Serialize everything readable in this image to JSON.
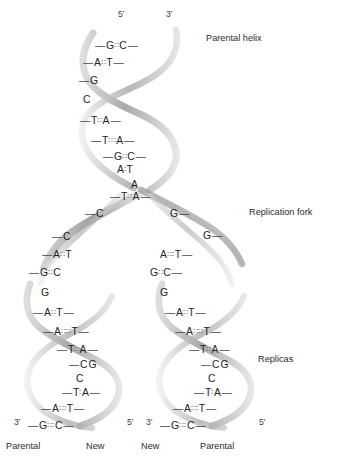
{
  "diagram": {
    "title_annotations": [
      {
        "name": "parental-helix",
        "label": "Parental helix",
        "x": 206,
        "y": 34
      },
      {
        "name": "replication-fork",
        "label": "Replication fork",
        "x": 249,
        "y": 208
      },
      {
        "name": "replicas",
        "label": "Replicas",
        "x": 258,
        "y": 355
      }
    ],
    "top_end_labels": [
      {
        "name": "five-prime-top",
        "label": "5′",
        "x": 118,
        "y": 10
      },
      {
        "name": "three-prime-top",
        "label": "3′",
        "x": 166,
        "y": 10
      }
    ],
    "bottom_end_labels": [
      {
        "name": "three-prime-left",
        "label": "3′",
        "x": 14,
        "y": 418
      },
      {
        "name": "five-prime-left",
        "label": "5′",
        "x": 127,
        "y": 418
      },
      {
        "name": "three-prime-right",
        "label": "3′",
        "x": 146,
        "y": 418
      },
      {
        "name": "five-prime-right",
        "label": "5′",
        "x": 259,
        "y": 418
      }
    ],
    "foot_labels": [
      {
        "name": "foot-parental-left",
        "label": "Parental",
        "x": 6,
        "y": 442
      },
      {
        "name": "foot-new-left",
        "label": "New",
        "x": 86,
        "y": 442
      },
      {
        "name": "foot-new-right",
        "label": "New",
        "x": 141,
        "y": 442
      },
      {
        "name": "foot-parental-right",
        "label": "Parental",
        "x": 200,
        "y": 442
      }
    ],
    "colors": {
      "ribbon_dark": "#8a8a8a",
      "ribbon_light": "#d2d2d2",
      "text": "#231f20",
      "background": "#ffffff"
    },
    "base_pairs": {
      "parental_helix": [
        {
          "left": "G",
          "right": "C",
          "bond": "∶∶",
          "ldash": true,
          "rdash": true,
          "x": 95,
          "y": 41
        },
        {
          "left": "A",
          "right": "T",
          "bond": "∶∶",
          "ldash": true,
          "rdash": true,
          "x": 83,
          "y": 58
        },
        {
          "left": "G",
          "right": "",
          "bond": "",
          "ldash": true,
          "rdash": false,
          "x": 79,
          "y": 76
        },
        {
          "left": "C",
          "right": "",
          "bond": "",
          "ldash": false,
          "rdash": false,
          "x": 83,
          "y": 95
        },
        {
          "left": "T",
          "right": "A",
          "bond": "∶∶",
          "ldash": true,
          "rdash": true,
          "x": 80,
          "y": 116
        },
        {
          "left": "T",
          "right": "A",
          "bond": "∶∶∶",
          "ldash": true,
          "rdash": true,
          "x": 91,
          "y": 136
        },
        {
          "left": "G",
          "right": "C",
          "bond": "∶∶",
          "ldash": true,
          "rdash": true,
          "x": 103,
          "y": 152
        },
        {
          "left": "A",
          "right": "T",
          "bond": "∶",
          "ldash": false,
          "rdash": false,
          "x": 117,
          "y": 165
        },
        {
          "left": "A",
          "right": "",
          "bond": "",
          "ldash": false,
          "rdash": false,
          "x": 131,
          "y": 180
        },
        {
          "left": "T",
          "right": "A",
          "bond": "∶∶",
          "ldash": true,
          "rdash": true,
          "x": 110,
          "y": 192
        }
      ],
      "fork_left_branch": [
        {
          "left": "C",
          "right": "",
          "bond": "",
          "ldash": true,
          "rdash": false,
          "x": 85,
          "y": 209
        },
        {
          "left": "C",
          "right": "",
          "bond": "",
          "ldash": true,
          "rdash": false,
          "x": 52,
          "y": 232
        },
        {
          "left": "A",
          "right": "T",
          "bond": "∶∶",
          "ldash": true,
          "rdash": false,
          "x": 42,
          "y": 250
        },
        {
          "left": "G",
          "right": "C",
          "bond": "∶∶",
          "ldash": true,
          "rdash": false,
          "x": 29,
          "y": 268
        },
        {
          "left": "G",
          "right": "",
          "bond": "",
          "ldash": false,
          "rdash": false,
          "x": 41,
          "y": 288
        }
      ],
      "fork_right_branch": [
        {
          "left": "G",
          "right": "",
          "bond": "",
          "ldash": false,
          "rdash": true,
          "x": 170,
          "y": 209
        },
        {
          "left": "G",
          "right": "",
          "bond": "",
          "ldash": false,
          "rdash": true,
          "x": 203,
          "y": 231
        },
        {
          "left": "A",
          "right": "T",
          "bond": "∶∶∶",
          "ldash": false,
          "rdash": true,
          "x": 160,
          "y": 250
        },
        {
          "left": "G",
          "right": "C",
          "bond": "∶∶",
          "ldash": false,
          "rdash": true,
          "x": 150,
          "y": 268
        },
        {
          "left": "G",
          "right": "",
          "bond": "",
          "ldash": false,
          "rdash": false,
          "x": 160,
          "y": 288
        }
      ],
      "replica_left": [
        {
          "left": "A",
          "right": "T",
          "bond": "∶∶",
          "ldash": true,
          "rdash": true,
          "x": 33,
          "y": 308
        },
        {
          "left": "A",
          "right": "T",
          "bond": "∶∶∶∶",
          "ldash": true,
          "rdash": true,
          "x": 43,
          "y": 327
        },
        {
          "left": "T",
          "right": "A",
          "bond": "∶∶",
          "ldash": true,
          "rdash": true,
          "x": 57,
          "y": 345
        },
        {
          "left": "C",
          "right": "G",
          "bond": "",
          "ldash": true,
          "rdash": false,
          "x": 69,
          "y": 360
        },
        {
          "left": "C",
          "right": "",
          "bond": "",
          "ldash": false,
          "rdash": false,
          "x": 76,
          "y": 374
        },
        {
          "left": "T",
          "right": "A",
          "bond": "∶",
          "ldash": true,
          "rdash": true,
          "x": 62,
          "y": 388
        },
        {
          "left": "A",
          "right": "T",
          "bond": "∶∶∶",
          "ldash": true,
          "rdash": true,
          "x": 41,
          "y": 404
        },
        {
          "left": "G",
          "right": "C",
          "bond": "∶∶∶",
          "ldash": true,
          "rdash": true,
          "x": 28,
          "y": 421
        }
      ],
      "replica_right": [
        {
          "left": "A",
          "right": "T",
          "bond": "∶∶",
          "ldash": true,
          "rdash": true,
          "x": 165,
          "y": 308
        },
        {
          "left": "A",
          "right": "T",
          "bond": "∶∶∶∶",
          "ldash": true,
          "rdash": true,
          "x": 175,
          "y": 327
        },
        {
          "left": "T",
          "right": "A",
          "bond": "∶∶",
          "ldash": true,
          "rdash": true,
          "x": 189,
          "y": 345
        },
        {
          "left": "C",
          "right": "G",
          "bond": "",
          "ldash": true,
          "rdash": false,
          "x": 201,
          "y": 360
        },
        {
          "left": "C",
          "right": "",
          "bond": "",
          "ldash": false,
          "rdash": false,
          "x": 208,
          "y": 374
        },
        {
          "left": "T",
          "right": "A",
          "bond": "∶",
          "ldash": true,
          "rdash": true,
          "x": 194,
          "y": 388
        },
        {
          "left": "A",
          "right": "T",
          "bond": "∶∶∶",
          "ldash": true,
          "rdash": true,
          "x": 173,
          "y": 404
        },
        {
          "left": "G",
          "right": "C",
          "bond": "∶∶∶",
          "ldash": true,
          "rdash": true,
          "x": 160,
          "y": 421
        }
      ]
    }
  }
}
